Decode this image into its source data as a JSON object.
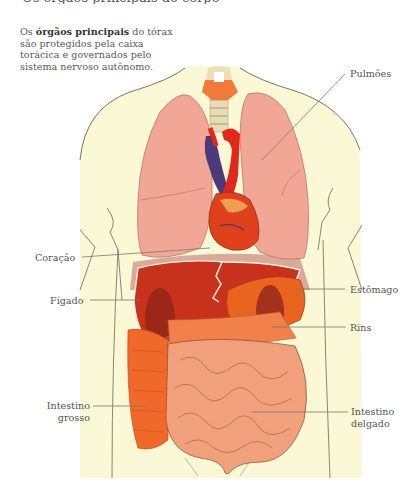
{
  "header": {
    "cut_title": "Os órgãos principais do corpo"
  },
  "intro": {
    "prefix": "Os ",
    "bold": "órgãos principais",
    "suffix": " do tórax são protegidos pela caixa torácica e governados pelo sistema nervoso autônomo."
  },
  "labels": {
    "lungs": "Pulmões",
    "heart": "Coração",
    "liver": "Fígado",
    "stomach": "Estômago",
    "kidneys": "Rins",
    "large_intestine_1": "Intestino",
    "large_intestine_2": "grosso",
    "small_intestine_1": "Intestino",
    "small_intestine_2": "delgado"
  },
  "colors": {
    "skin": "#fbf8d6",
    "outline": "#6a6a5a",
    "lungs": "#f2a796",
    "liver": "#c8321c",
    "stomach": "#e8641f",
    "kidneys": "#8e2418",
    "large_intestine": "#f0682a",
    "small_intestine": "#f0a07a",
    "vein": "#4a3a7a",
    "artery": "#e0281c",
    "trachea": "#e8dcb6",
    "thyroid": "#f07a3a"
  }
}
